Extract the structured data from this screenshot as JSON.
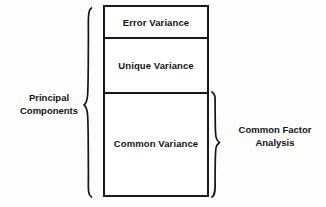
{
  "diagram": {
    "box": {
      "segments": [
        {
          "id": "error",
          "label": "Error Variance"
        },
        {
          "id": "unique",
          "label": "Unique Variance"
        },
        {
          "id": "common",
          "label": "Common Variance"
        }
      ]
    },
    "left_annotation": {
      "brace": "left-curly-brace",
      "line1": "Principal",
      "line2": "Components",
      "covers": [
        "Error Variance",
        "Unique Variance",
        "Common Variance"
      ]
    },
    "right_annotation": {
      "brace": "right-curly-brace",
      "line1": "Common Factor",
      "line2": "Analysis",
      "covers": [
        "Common Variance"
      ]
    },
    "colors": {
      "background": "#fdfdfc",
      "box_fill": "#ffffff",
      "stroke": "#1a1a1a",
      "text": "#141414"
    }
  }
}
